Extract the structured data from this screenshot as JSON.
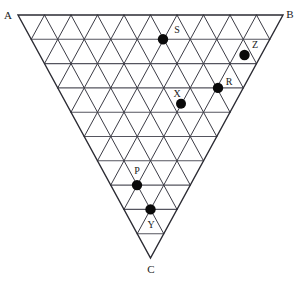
{
  "figure": {
    "type": "triangular-lattice",
    "orientation": "apex-down",
    "rows": 10,
    "background_color": "#ffffff",
    "line_color": "#3c3c46",
    "boundary_color": "#2b2b33",
    "dot_color": "#0a0a0a",
    "geometry": {
      "top_left": {
        "x": 18,
        "y": 15
      },
      "top_right": {
        "x": 283,
        "y": 15
      },
      "apex": {
        "x": 150.5,
        "y": 258
      },
      "cell_width": 26.5,
      "row_height": 24.3
    }
  },
  "vertex_labels": [
    {
      "id": "A",
      "text": "A",
      "x": 8,
      "y": 16
    },
    {
      "id": "B",
      "text": "B",
      "x": 290,
      "y": 15
    },
    {
      "id": "C",
      "text": "C",
      "x": 151,
      "y": 270
    }
  ],
  "points": [
    {
      "id": "S",
      "label": "S",
      "row": 1,
      "col": 5,
      "cx": 163,
      "cy": 39.3,
      "r": 5.2,
      "label_x": 177,
      "label_y": 31
    },
    {
      "id": "Z",
      "label": "Z",
      "row": 2,
      "col": 8,
      "cx": 244.5,
      "cy": 55.0,
      "r": 5.2,
      "label_x": 255,
      "label_y": 46
    },
    {
      "id": "R",
      "label": "R",
      "row": 3,
      "col": 7,
      "cx": 218.0,
      "cy": 87.9,
      "r": 5.2,
      "label_x": 229,
      "label_y": 83
    },
    {
      "id": "X",
      "label": "X",
      "row": 4,
      "col": 5,
      "cx": 181.0,
      "cy": 103.8,
      "r": 5.0,
      "label_x": 177,
      "label_y": 95
    },
    {
      "id": "P",
      "label": "P",
      "row": 7,
      "col": 3,
      "cx": 137.0,
      "cy": 185.1,
      "r": 5.2,
      "label_x": 137,
      "label_y": 172
    },
    {
      "id": "Y",
      "label": "Y",
      "row": 8,
      "col": 3,
      "cx": 150.5,
      "cy": 209.4,
      "r": 5.2,
      "label_x": 151,
      "label_y": 226
    }
  ],
  "accent_colors": {
    "line": "#3c3c46",
    "boundary": "#2b2b33",
    "dot": "#0a0a0a",
    "label": "#1a1a1a",
    "background": "#ffffff"
  }
}
